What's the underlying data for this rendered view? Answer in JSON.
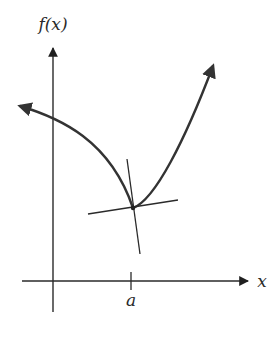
{
  "figure": {
    "y_axis_label": "f(x)",
    "x_axis_label": "x",
    "tick_label": "a"
  },
  "colors": {
    "background": "#ffffff",
    "axis": "#2a2a2a",
    "curve": "#333333",
    "tangent": "#2a2a2a"
  },
  "geometry": {
    "corner_point": {
      "x": 133,
      "y": 208
    },
    "y_axis": {
      "x": 53,
      "top": 45,
      "bottom": 312
    },
    "x_axis": {
      "y": 281,
      "left": 22,
      "right": 250
    },
    "tick_a": {
      "x": 131
    }
  }
}
